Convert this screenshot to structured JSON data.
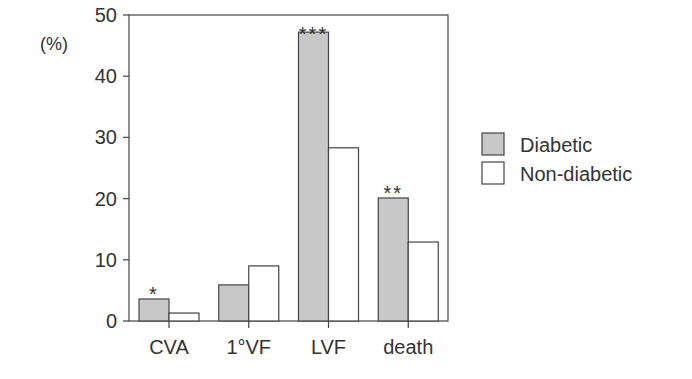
{
  "chart_data": {
    "type": "bar",
    "title": "",
    "xlabel": "",
    "ylabel": "(%)",
    "ylim": [
      0,
      50
    ],
    "yticks": [
      0,
      10,
      20,
      30,
      40,
      50
    ],
    "grid": false,
    "legend_position": "right",
    "categories": [
      "CVA",
      "1°VF",
      "LVF",
      "death"
    ],
    "series": [
      {
        "name": "Diabetic",
        "color": "#c8c8c8",
        "values": [
          3.6,
          5.9,
          47.2,
          20.1
        ]
      },
      {
        "name": "Non-diabetic",
        "color": "#ffffff",
        "values": [
          1.3,
          9.0,
          28.3,
          12.9
        ]
      }
    ],
    "annotations": [
      "*",
      "",
      "***",
      "**"
    ]
  }
}
